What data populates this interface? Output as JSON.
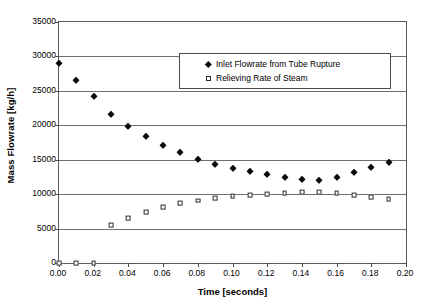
{
  "chart_data": {
    "type": "scatter",
    "title": "",
    "xlabel": "Time [seconds]",
    "ylabel": "Mass Flowrate [kg/h]",
    "xlim": [
      0.0,
      0.2
    ],
    "ylim": [
      0,
      35000
    ],
    "xticks": [
      "0.00",
      "0.02",
      "0.04",
      "0.06",
      "0.08",
      "0.10",
      "0.12",
      "0.14",
      "0.16",
      "0.18",
      "0.20"
    ],
    "xtick_values": [
      0.0,
      0.02,
      0.04,
      0.06,
      0.08,
      0.1,
      0.12,
      0.14,
      0.16,
      0.18,
      0.2
    ],
    "yticks": [
      "0",
      "5000",
      "10000",
      "15000",
      "20000",
      "25000",
      "30000",
      "35000"
    ],
    "ytick_values": [
      0,
      5000,
      10000,
      15000,
      20000,
      25000,
      30000,
      35000
    ],
    "grid": "horizontal",
    "legend_position": "upper-center",
    "x": [
      0.0,
      0.01,
      0.02,
      0.03,
      0.04,
      0.05,
      0.06,
      0.07,
      0.08,
      0.09,
      0.1,
      0.11,
      0.12,
      0.13,
      0.14,
      0.15,
      0.16,
      0.17,
      0.18,
      0.19
    ],
    "series": [
      {
        "name": "Inlet Flowrate from Tube Rupture",
        "marker": "filled-diamond",
        "color": "#0a0a0a",
        "values": [
          29000,
          26550,
          24200,
          21700,
          19950,
          18450,
          17150,
          16100,
          15150,
          14400,
          13850,
          13350,
          12900,
          12550,
          12250,
          12100,
          12500,
          13250,
          14000,
          14700
        ]
      },
      {
        "name": "Relieving Rate of Steam",
        "marker": "open-square",
        "color": "#2b2b2b",
        "values": [
          0,
          0,
          0,
          5500,
          6550,
          7350,
          8100,
          8650,
          9050,
          9400,
          9700,
          9900,
          10050,
          10200,
          10300,
          10280,
          10150,
          9900,
          9550,
          9250
        ]
      }
    ]
  },
  "legend": {
    "entries": [
      {
        "label": "Inlet Flowrate from Tube Rupture",
        "marker": "filled-diamond"
      },
      {
        "label": "Relieving Rate of Steam",
        "marker": "open-square"
      }
    ]
  }
}
